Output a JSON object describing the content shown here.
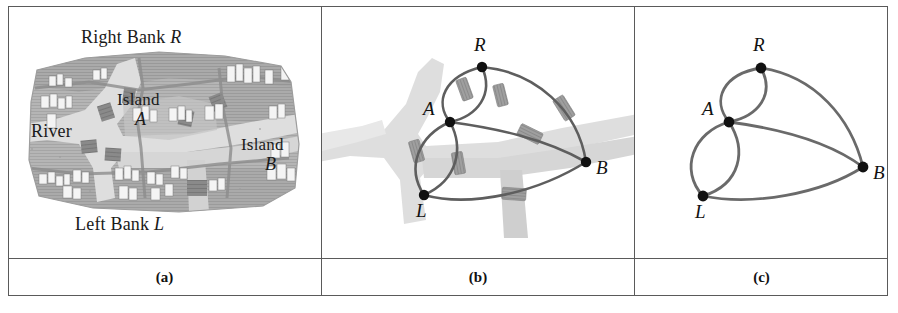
{
  "figure": {
    "panels": [
      {
        "id": "a",
        "caption": "(a)",
        "kind": "map"
      },
      {
        "id": "b",
        "caption": "(b)",
        "kind": "graph-over-map"
      },
      {
        "id": "c",
        "caption": "(c)",
        "kind": "graph"
      }
    ]
  },
  "map": {
    "labels": {
      "right_bank": "Right Bank ",
      "right_bank_symbol": "R",
      "left_bank": "Left Bank ",
      "left_bank_symbol": "L",
      "river": "River",
      "island_a": "Island",
      "island_a_symbol": "A",
      "island_b": "Island",
      "island_b_symbol": "B"
    }
  },
  "graph": {
    "title": "Bridges of Konigsberg multigraph",
    "nodes": [
      {
        "id": "R",
        "label": "R",
        "name": "Right Bank"
      },
      {
        "id": "A",
        "label": "A",
        "name": "Island A"
      },
      {
        "id": "B",
        "label": "B",
        "name": "Island B"
      },
      {
        "id": "L",
        "label": "L",
        "name": "Left Bank"
      }
    ],
    "edges": [
      {
        "from": "A",
        "to": "R",
        "bridge": 1
      },
      {
        "from": "A",
        "to": "R",
        "bridge": 2
      },
      {
        "from": "A",
        "to": "L",
        "bridge": 3
      },
      {
        "from": "A",
        "to": "L",
        "bridge": 4
      },
      {
        "from": "A",
        "to": "B",
        "bridge": 5
      },
      {
        "from": "R",
        "to": "B",
        "bridge": 6
      },
      {
        "from": "L",
        "to": "B",
        "bridge": 7
      }
    ],
    "edge_count": 7,
    "degrees": {
      "A": 5,
      "R": 3,
      "L": 3,
      "B": 3
    }
  },
  "panel_b": {
    "nodes": {
      "R": {
        "x": 160,
        "y": 61,
        "label": "R"
      },
      "A": {
        "x": 128,
        "y": 116,
        "label": "A"
      },
      "L": {
        "x": 102,
        "y": 189,
        "label": "L"
      },
      "B": {
        "x": 264,
        "y": 156,
        "label": "B"
      }
    },
    "bridge_markers": 7
  },
  "panel_c": {
    "nodes": {
      "R": {
        "x": 126,
        "y": 62,
        "label": "R"
      },
      "A": {
        "x": 94,
        "y": 116,
        "label": "A"
      },
      "L": {
        "x": 68,
        "y": 190,
        "label": "L"
      },
      "B": {
        "x": 228,
        "y": 161,
        "label": "B"
      }
    }
  },
  "colors": {
    "border": "#5a5a5a",
    "edge": "#5e5e5e",
    "node": "#111111",
    "river": "#c9c9c9",
    "bridge": "#9a9a9a",
    "text": "#1a1a1a",
    "background": "#ffffff"
  }
}
